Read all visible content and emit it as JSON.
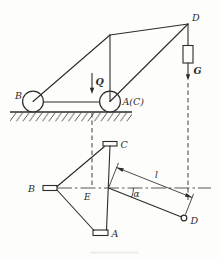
{
  "figure": {
    "kind": "statics-mechanism-diagram",
    "views": [
      "side-elevation",
      "plan-projection"
    ]
  },
  "colors": {
    "ink": "#2b2b2b",
    "paper": "#fdfdfb"
  },
  "labels": {
    "top": {
      "b": "B",
      "ac": "A(C)",
      "d": "D",
      "q": "Q",
      "g": "G"
    },
    "bottom": {
      "b": "B",
      "e": "E",
      "c": "C",
      "a": "A",
      "d": "D",
      "length": "l",
      "angle": "α"
    }
  }
}
